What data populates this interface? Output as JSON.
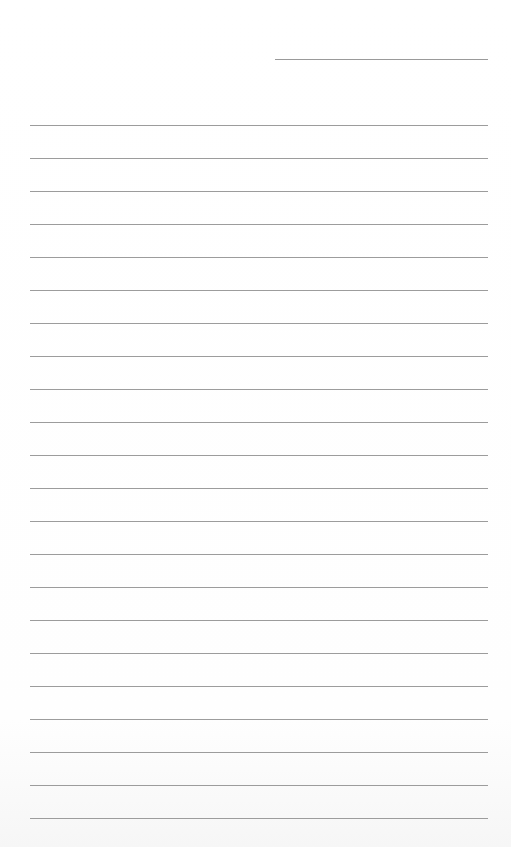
{
  "document": {
    "type": "lined-paper",
    "header_line": {
      "present": true
    },
    "rules": {
      "count": 22,
      "first_top": 125,
      "spacing": 33,
      "color": "#9c9c9c"
    },
    "lines": [
      "",
      "",
      "",
      "",
      "",
      "",
      "",
      "",
      "",
      "",
      "",
      "",
      "",
      "",
      "",
      "",
      "",
      "",
      "",
      "",
      "",
      ""
    ]
  }
}
